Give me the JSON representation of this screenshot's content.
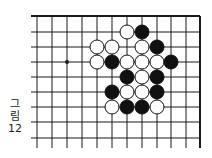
{
  "figure": {
    "caption_line1": "그",
    "caption_line2": "림",
    "caption_number": "12"
  },
  "board": {
    "columns_x": [
      37,
      52,
      67,
      82,
      97,
      112,
      127,
      142,
      157,
      171,
      186,
      200
    ],
    "rows_y": [
      16,
      32,
      47,
      62,
      77,
      92,
      107,
      122,
      138
    ],
    "line_left": 31,
    "line_bottom": 148,
    "top_edge": true,
    "right_edge": true,
    "star_points": [
      {
        "col": 2,
        "row": 3
      }
    ],
    "stone_radius": 7,
    "colors": {
      "line": "#1a1a1a",
      "black": "#111111",
      "white": "#ffffff"
    },
    "stones": [
      {
        "color": "white",
        "col": 6,
        "row": 1
      },
      {
        "color": "black",
        "col": 7,
        "row": 1
      },
      {
        "color": "white",
        "col": 4,
        "row": 2
      },
      {
        "color": "white",
        "col": 5,
        "row": 2
      },
      {
        "color": "white",
        "col": 7,
        "row": 2
      },
      {
        "color": "black",
        "col": 8,
        "row": 2
      },
      {
        "color": "white",
        "col": 4,
        "row": 3
      },
      {
        "color": "black",
        "col": 5,
        "row": 3
      },
      {
        "color": "white",
        "col": 6,
        "row": 3
      },
      {
        "color": "white",
        "col": 7,
        "row": 3
      },
      {
        "color": "white",
        "col": 8,
        "row": 3
      },
      {
        "color": "black",
        "col": 9,
        "row": 3
      },
      {
        "color": "black",
        "col": 6,
        "row": 4
      },
      {
        "color": "white",
        "col": 7,
        "row": 4
      },
      {
        "color": "black",
        "col": 8,
        "row": 4
      },
      {
        "color": "black",
        "col": 5,
        "row": 5
      },
      {
        "color": "white",
        "col": 6,
        "row": 5
      },
      {
        "color": "white",
        "col": 7,
        "row": 5
      },
      {
        "color": "black",
        "col": 8,
        "row": 5
      },
      {
        "color": "white",
        "col": 5,
        "row": 6
      },
      {
        "color": "black",
        "col": 6,
        "row": 6
      },
      {
        "color": "black",
        "col": 7,
        "row": 6
      },
      {
        "color": "white",
        "col": 8,
        "row": 6
      }
    ]
  }
}
